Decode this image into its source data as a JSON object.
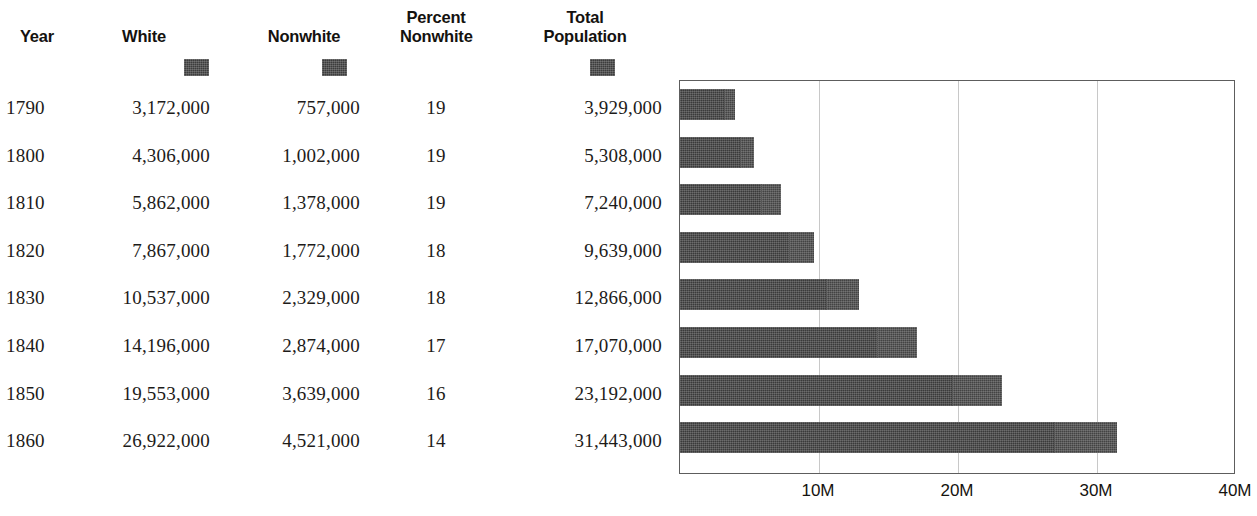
{
  "table": {
    "columns": [
      {
        "key": "year",
        "label": "Year",
        "label_line2": "",
        "has_swatch": false
      },
      {
        "key": "white",
        "label": "White",
        "label_line2": "",
        "has_swatch": true
      },
      {
        "key": "nonwhite",
        "label": "Nonwhite",
        "label_line2": "",
        "has_swatch": true
      },
      {
        "key": "pct",
        "label": "Percent",
        "label_line2": "Nonwhite",
        "has_swatch": false
      },
      {
        "key": "total",
        "label": "Total",
        "label_line2": "Population",
        "has_swatch": true
      }
    ],
    "rows": [
      {
        "year": "1790",
        "white": "3,172,000",
        "nonwhite": "757,000",
        "pct": "19",
        "total": "3,929,000"
      },
      {
        "year": "1800",
        "white": "4,306,000",
        "nonwhite": "1,002,000",
        "pct": "19",
        "total": "5,308,000"
      },
      {
        "year": "1810",
        "white": "5,862,000",
        "nonwhite": "1,378,000",
        "pct": "19",
        "total": "7,240,000"
      },
      {
        "year": "1820",
        "white": "7,867,000",
        "nonwhite": "1,772,000",
        "pct": "18",
        "total": "9,639,000"
      },
      {
        "year": "1830",
        "white": "10,537,000",
        "nonwhite": "2,329,000",
        "pct": "18",
        "total": "12,866,000"
      },
      {
        "year": "1840",
        "white": "14,196,000",
        "nonwhite": "2,874,000",
        "pct": "17",
        "total": "17,070,000"
      },
      {
        "year": "1850",
        "white": "19,553,000",
        "nonwhite": "3,639,000",
        "pct": "16",
        "total": "23,192,000"
      },
      {
        "year": "1860",
        "white": "26,922,000",
        "nonwhite": "4,521,000",
        "pct": "14",
        "total": "31,443,000"
      }
    ]
  },
  "chart_data": {
    "type": "bar",
    "orientation": "horizontal",
    "stacked": true,
    "title": "",
    "xlabel": "",
    "ylabel": "",
    "categories": [
      "1790",
      "1800",
      "1810",
      "1820",
      "1830",
      "1840",
      "1850",
      "1860"
    ],
    "series": [
      {
        "name": "White",
        "color": "#3a3a3a",
        "values": [
          3172000,
          4306000,
          5862000,
          7867000,
          10537000,
          14196000,
          19553000,
          26922000
        ]
      },
      {
        "name": "Nonwhite",
        "color": "#434343",
        "values": [
          757000,
          1002000,
          1378000,
          1772000,
          2329000,
          2874000,
          3639000,
          4521000
        ]
      }
    ],
    "totals": [
      3929000,
      5308000,
      7240000,
      9639000,
      12866000,
      17070000,
      23192000,
      31443000
    ],
    "percent_nonwhite": [
      19,
      19,
      19,
      18,
      18,
      17,
      16,
      14
    ],
    "xlim": [
      0,
      40000000
    ],
    "xticks": [
      10000000,
      20000000,
      30000000,
      40000000
    ],
    "xtick_labels": [
      "10M",
      "20M",
      "30M",
      "40M"
    ],
    "grid": true,
    "legend": "none"
  },
  "style": {
    "bar_color": "#3a3a3a",
    "frame_color": "#5d5d5d",
    "grid_color": "#c8c8c8",
    "text_color": "#1d1b19"
  }
}
